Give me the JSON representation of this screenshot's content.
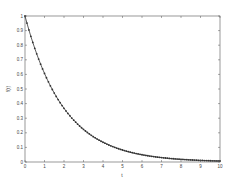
{
  "chart_data": {
    "type": "line",
    "title": "",
    "xlabel": "t",
    "ylabel": "f(t)",
    "xlim": [
      0,
      10
    ],
    "ylim": [
      0,
      1
    ],
    "xticks": [
      0,
      1,
      2,
      3,
      4,
      5,
      6,
      7,
      8,
      9,
      10
    ],
    "yticks": [
      0,
      0.1,
      0.2,
      0.3,
      0.4,
      0.5,
      0.6,
      0.7,
      0.8,
      0.9,
      1
    ],
    "grid": false,
    "legend": null,
    "series": [
      {
        "name": "f(t)",
        "function": "exp(-t/2)",
        "marker": "dot",
        "color": "#333333",
        "x": [
          0,
          0.5,
          1,
          1.5,
          2,
          2.5,
          3,
          3.5,
          4,
          4.5,
          5,
          5.5,
          6,
          6.5,
          7,
          7.5,
          8,
          8.5,
          9,
          9.5,
          10
        ],
        "y": [
          1,
          0.779,
          0.607,
          0.472,
          0.368,
          0.287,
          0.223,
          0.174,
          0.135,
          0.105,
          0.082,
          0.064,
          0.05,
          0.039,
          0.03,
          0.024,
          0.018,
          0.014,
          0.011,
          0.009,
          0.007
        ]
      }
    ]
  },
  "style": {
    "axis_color": "#555555",
    "line_color": "#333333",
    "background": "#ffffff"
  }
}
